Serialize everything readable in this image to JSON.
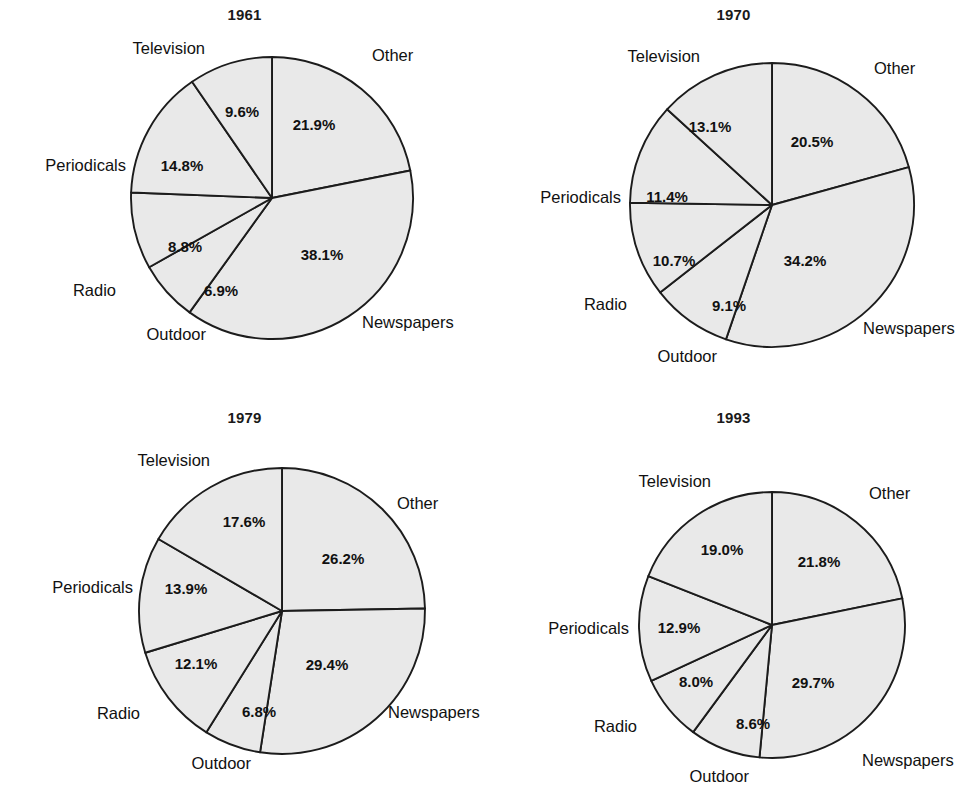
{
  "figure": {
    "background": "#ffffff",
    "slice_fill": "#e9e9e9",
    "slice_stroke": "#1c1c1c",
    "text_color": "#111111"
  },
  "chart_data": [
    {
      "type": "pie",
      "title": "1961",
      "xlabel": "",
      "ylabel": "",
      "legend": "none",
      "grid": false,
      "start_angle_deg": 0,
      "direction": "clockwise",
      "categories": [
        "Other",
        "Newspapers",
        "Outdoor",
        "Radio",
        "Periodicals",
        "Television"
      ],
      "values": [
        21.9,
        38.1,
        6.9,
        8.8,
        14.8,
        9.6
      ],
      "labels": [
        "21.9%",
        "38.1%",
        "6.9%",
        "8.8%",
        "14.8%",
        "9.6%"
      ],
      "panel": {
        "left": 0,
        "top": 0
      },
      "center": {
        "x": 272,
        "y": 198
      },
      "radius": 141,
      "pct_positions": [
        {
          "x": 314,
          "y": 126
        },
        {
          "x": 322,
          "y": 256
        },
        {
          "x": 221,
          "y": 292
        },
        {
          "x": 185,
          "y": 248
        },
        {
          "x": 182,
          "y": 167
        },
        {
          "x": 242,
          "y": 113
        }
      ],
      "cat_positions": [
        {
          "x": 372,
          "y": 57,
          "anchor": "start",
          "text": "Other"
        },
        {
          "x": 362,
          "y": 324,
          "anchor": "start",
          "text": "Newspapers"
        },
        {
          "x": 206,
          "y": 336,
          "anchor": "end",
          "text": "Outdoor"
        },
        {
          "x": 116,
          "y": 292,
          "anchor": "end",
          "text": "Radio"
        },
        {
          "x": 126,
          "y": 167,
          "anchor": "end",
          "text": "Periodicals"
        },
        {
          "x": 205,
          "y": 50,
          "anchor": "end",
          "text": "Television"
        }
      ]
    },
    {
      "type": "pie",
      "title": "1970",
      "xlabel": "",
      "ylabel": "",
      "legend": "none",
      "grid": false,
      "start_angle_deg": 0,
      "direction": "clockwise",
      "categories": [
        "Other",
        "Newspapers",
        "Outdoor",
        "Radio",
        "Periodicals",
        "Television"
      ],
      "values": [
        20.5,
        34.2,
        9.1,
        10.7,
        11.4,
        13.1
      ],
      "labels": [
        "20.5%",
        "34.2%",
        "9.1%",
        "10.7%",
        "11.4%",
        "13.1%"
      ],
      "panel": {
        "left": 489,
        "top": 0
      },
      "center": {
        "x": 283,
        "y": 205
      },
      "radius": 142,
      "pct_positions": [
        {
          "x": 323,
          "y": 143
        },
        {
          "x": 316,
          "y": 262
        },
        {
          "x": 240,
          "y": 307
        },
        {
          "x": 185,
          "y": 262
        },
        {
          "x": 178,
          "y": 198
        },
        {
          "x": 221,
          "y": 128
        }
      ],
      "cat_positions": [
        {
          "x": 385,
          "y": 70,
          "anchor": "start",
          "text": "Other"
        },
        {
          "x": 374,
          "y": 330,
          "anchor": "start",
          "text": "Newspapers"
        },
        {
          "x": 228,
          "y": 358,
          "anchor": "end",
          "text": "Outdoor"
        },
        {
          "x": 138,
          "y": 306,
          "anchor": "end",
          "text": "Radio"
        },
        {
          "x": 132,
          "y": 199,
          "anchor": "end",
          "text": "Periodicals"
        },
        {
          "x": 211,
          "y": 58,
          "anchor": "end",
          "text": "Television"
        }
      ]
    },
    {
      "type": "pie",
      "title": "1979",
      "xlabel": "",
      "ylabel": "",
      "legend": "none",
      "grid": false,
      "start_angle_deg": 0,
      "direction": "clockwise",
      "categories": [
        "Other",
        "Newspapers",
        "Outdoor",
        "Radio",
        "Periodicals",
        "Television"
      ],
      "values": [
        26.2,
        29.4,
        6.8,
        12.1,
        13.9,
        17.6
      ],
      "labels": [
        "26.2%",
        "29.4%",
        "6.8%",
        "12.1%",
        "13.9%",
        "17.6%"
      ],
      "panel": {
        "left": 0,
        "top": 403
      },
      "center": {
        "x": 282,
        "y": 208
      },
      "radius": 143,
      "pct_positions": [
        {
          "x": 343,
          "y": 157
        },
        {
          "x": 327,
          "y": 263
        },
        {
          "x": 259,
          "y": 310
        },
        {
          "x": 196,
          "y": 262
        },
        {
          "x": 186,
          "y": 187
        },
        {
          "x": 244,
          "y": 120
        }
      ],
      "cat_positions": [
        {
          "x": 397,
          "y": 102,
          "anchor": "start",
          "text": "Other"
        },
        {
          "x": 388,
          "y": 311,
          "anchor": "start",
          "text": "Newspapers"
        },
        {
          "x": 251,
          "y": 362,
          "anchor": "end",
          "text": "Outdoor"
        },
        {
          "x": 140,
          "y": 312,
          "anchor": "end",
          "text": "Radio"
        },
        {
          "x": 133,
          "y": 186,
          "anchor": "end",
          "text": "Periodicals"
        },
        {
          "x": 210,
          "y": 59,
          "anchor": "end",
          "text": "Television"
        }
      ]
    },
    {
      "type": "pie",
      "title": "1993",
      "xlabel": "",
      "ylabel": "",
      "legend": "none",
      "grid": false,
      "start_angle_deg": 0,
      "direction": "clockwise",
      "categories": [
        "Other",
        "Newspapers",
        "Outdoor",
        "Radio",
        "Periodicals",
        "Television"
      ],
      "values": [
        21.8,
        29.7,
        8.6,
        8.0,
        12.9,
        19.0
      ],
      "labels": [
        "21.8%",
        "29.7%",
        "8.6%",
        "8.0%",
        "12.9%",
        "19.0%"
      ],
      "panel": {
        "left": 489,
        "top": 403
      },
      "center": {
        "x": 283,
        "y": 222
      },
      "radius": 133,
      "pct_positions": [
        {
          "x": 330,
          "y": 160
        },
        {
          "x": 324,
          "y": 281
        },
        {
          "x": 264,
          "y": 322
        },
        {
          "x": 207,
          "y": 280
        },
        {
          "x": 190,
          "y": 226
        },
        {
          "x": 233,
          "y": 148
        }
      ],
      "cat_positions": [
        {
          "x": 380,
          "y": 92,
          "anchor": "start",
          "text": "Other"
        },
        {
          "x": 373,
          "y": 359,
          "anchor": "start",
          "text": "Newspapers"
        },
        {
          "x": 260,
          "y": 375,
          "anchor": "end",
          "text": "Outdoor"
        },
        {
          "x": 148,
          "y": 325,
          "anchor": "end",
          "text": "Radio"
        },
        {
          "x": 140,
          "y": 227,
          "anchor": "end",
          "text": "Periodicals"
        },
        {
          "x": 222,
          "y": 80,
          "anchor": "end",
          "text": "Television"
        }
      ]
    }
  ]
}
